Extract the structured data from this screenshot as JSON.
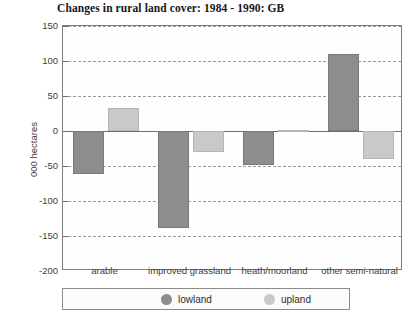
{
  "chart_data": {
    "type": "bar",
    "title": "Changes in rural land cover: 1984 - 1990: GB",
    "xlabel": "",
    "ylabel": "000 hectares",
    "ylim": [
      -200,
      150
    ],
    "ytick_step": 50,
    "yticks": [
      150,
      100,
      50,
      0,
      -50,
      -100,
      -150,
      -200
    ],
    "ytick_labels": [
      "150",
      "100",
      "50",
      "0",
      "-50",
      "-100",
      "-150",
      "-200"
    ],
    "grid": true,
    "grid_style": "dashed",
    "legend_position": "bottom",
    "categories": [
      "arable",
      "improved grassland",
      "heath/moorland",
      "other semi-natural"
    ],
    "series": [
      {
        "name": "lowland",
        "color": "#8d8d8d",
        "values": [
          -62,
          -138,
          -49,
          110
        ]
      },
      {
        "name": "upland",
        "color": "#c9c9c9",
        "values": [
          33,
          -30,
          2,
          -40
        ]
      }
    ]
  },
  "colors": {
    "lowland": "#8d8d8d",
    "upland": "#c9c9c9",
    "axis": "#6f6f6f",
    "grid": "#9a9a9a",
    "text": "#3d3d3d",
    "title": "#16161a",
    "plot_background": "#fefefe",
    "page_background": "#ffffff"
  }
}
